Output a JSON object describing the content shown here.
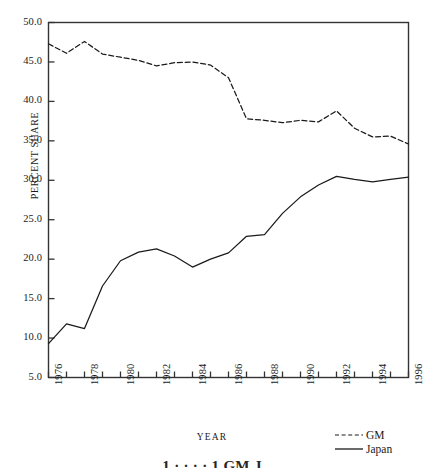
{
  "chart_data": {
    "type": "line",
    "title": "",
    "xlabel": "YEAR",
    "ylabel": "PERCENT SHARE",
    "xlim": [
      1976,
      1996
    ],
    "ylim": [
      5.0,
      50.0
    ],
    "grid": false,
    "legend_position": "bottom-right",
    "x": [
      1976,
      1977,
      1978,
      1979,
      1980,
      1981,
      1982,
      1983,
      1984,
      1985,
      1986,
      1987,
      1988,
      1989,
      1990,
      1991,
      1992,
      1993,
      1994,
      1995,
      1996
    ],
    "ytick_labels": [
      "50.0",
      "45.0",
      "40.0",
      "35.0",
      "30.0",
      "25.0",
      "20.0",
      "15.0",
      "10.0",
      "5.0"
    ],
    "ytick_values": [
      50.0,
      45.0,
      40.0,
      35.0,
      30.0,
      25.0,
      20.0,
      15.0,
      10.0,
      5.0
    ],
    "xtick_labels": [
      "1976",
      "1978",
      "1980",
      "1982",
      "1984",
      "1986",
      "1988",
      "1990",
      "1992",
      "1994",
      "1996"
    ],
    "xtick_values": [
      1976,
      1978,
      1980,
      1982,
      1984,
      1986,
      1988,
      1990,
      1992,
      1994,
      1996
    ],
    "series": [
      {
        "name": "GM",
        "style": "dashed",
        "color": "#1a1a1a",
        "values": [
          47.3,
          46.1,
          47.6,
          46.0,
          45.6,
          45.2,
          44.5,
          44.9,
          45.0,
          44.6,
          43.0,
          37.8,
          37.6,
          37.3,
          37.6,
          37.4,
          38.8,
          36.6,
          35.5,
          35.6,
          34.6
        ]
      },
      {
        "name": "Japan",
        "style": "solid",
        "color": "#1a1a1a",
        "values": [
          9.3,
          11.8,
          11.2,
          16.6,
          19.8,
          20.9,
          21.3,
          20.4,
          19.0,
          20.0,
          20.8,
          22.9,
          23.1,
          25.8,
          27.9,
          29.4,
          30.5,
          30.1,
          29.8,
          30.1,
          30.4
        ]
      }
    ]
  },
  "legend": {
    "items": [
      {
        "label": "GM",
        "style": "dashed"
      },
      {
        "label": "Japan",
        "style": "solid"
      }
    ]
  },
  "caption": {
    "text": "1 · · · · 1 GM  J"
  }
}
